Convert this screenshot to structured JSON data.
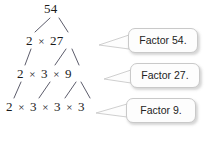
{
  "diagram": {
    "type": "factor-tree",
    "root": "54",
    "rows": [
      {
        "terms": [
          "54"
        ],
        "operator": ""
      },
      {
        "terms": [
          "2",
          "27"
        ],
        "operator": "×"
      },
      {
        "terms": [
          "2",
          "3",
          "9"
        ],
        "operator": "×"
      },
      {
        "terms": [
          "2",
          "3",
          "3",
          "3"
        ],
        "operator": "×"
      }
    ],
    "row_text": [
      "54",
      "2 × 27",
      "2 × 3 × 9",
      "2 × 3 × 3 × 3"
    ],
    "callouts": [
      {
        "label": "Factor 54."
      },
      {
        "label": "Factor 27."
      },
      {
        "label": "Factor 9."
      }
    ],
    "colors": {
      "text": "#1b1b1b",
      "branch": "#4a4a5a",
      "callout_fill": "#fdfdfd",
      "callout_border": "#c9c9c9",
      "callout_text": "#232323",
      "background": "#ffffff"
    }
  }
}
